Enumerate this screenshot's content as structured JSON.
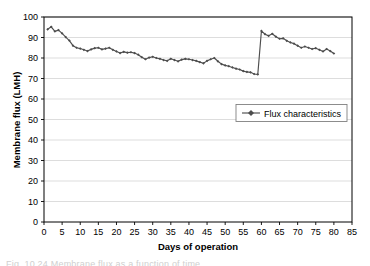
{
  "chart_data": {
    "type": "line",
    "title": "",
    "xlabel": "Days of operation",
    "ylabel": "Membrane flux (LMH)",
    "xlim": [
      0,
      85
    ],
    "ylim": [
      0,
      100
    ],
    "xticks": [
      0,
      5,
      10,
      15,
      20,
      25,
      30,
      35,
      40,
      45,
      50,
      55,
      60,
      65,
      70,
      75,
      80,
      85
    ],
    "yticks": [
      0,
      10,
      20,
      30,
      40,
      50,
      60,
      70,
      80,
      90,
      100
    ],
    "grid": "horizontal",
    "legend_position": "center-right",
    "series": [
      {
        "name": "Flux characteristics",
        "color": "#4d4d4d",
        "marker": "diamond",
        "x": [
          1,
          2,
          3,
          4,
          5,
          6,
          7,
          8,
          9,
          10,
          11,
          12,
          13,
          14,
          15,
          16,
          17,
          18,
          19,
          20,
          21,
          22,
          23,
          24,
          25,
          26,
          27,
          28,
          29,
          30,
          31,
          32,
          33,
          34,
          35,
          36,
          37,
          38,
          39,
          40,
          41,
          42,
          43,
          44,
          45,
          46,
          47,
          48,
          49,
          50,
          51,
          52,
          53,
          54,
          55,
          56,
          57,
          58,
          59,
          60,
          61,
          62,
          63,
          64,
          65,
          66,
          67,
          68,
          69,
          70,
          71,
          72,
          73,
          74,
          75,
          76,
          77,
          78,
          79,
          80
        ],
        "values": [
          94.0,
          95.2,
          93.0,
          93.6,
          92.0,
          90.2,
          88.5,
          86.0,
          85.0,
          84.6,
          84.0,
          83.4,
          84.2,
          84.8,
          85.0,
          84.2,
          84.6,
          85.0,
          84.0,
          83.2,
          82.4,
          83.0,
          82.6,
          82.8,
          82.4,
          81.6,
          80.4,
          79.4,
          80.2,
          80.6,
          80.0,
          79.6,
          79.0,
          78.6,
          79.6,
          79.0,
          78.4,
          79.2,
          79.6,
          79.4,
          79.0,
          78.6,
          78.0,
          77.4,
          78.6,
          79.4,
          80.0,
          78.4,
          77.0,
          76.4,
          76.0,
          75.4,
          74.8,
          74.4,
          73.6,
          73.2,
          73.0,
          72.2,
          72.0,
          93.2,
          91.6,
          90.8,
          91.8,
          90.4,
          89.4,
          89.6,
          88.4,
          87.6,
          87.0,
          86.0,
          85.0,
          85.6,
          85.0,
          84.4,
          84.8,
          84.0,
          83.2,
          84.4,
          83.4,
          82.2
        ]
      }
    ]
  },
  "legend": {
    "entries": [
      {
        "label": "Flux characteristics"
      }
    ]
  },
  "axes": {
    "y_title": "Membrane flux (LMH)",
    "x_title": "Days of operation",
    "x_tick_labels": [
      "0",
      "5",
      "10",
      "15",
      "20",
      "25",
      "30",
      "35",
      "40",
      "45",
      "50",
      "55",
      "60",
      "65",
      "70",
      "75",
      "80",
      "85"
    ],
    "y_tick_labels": [
      "0",
      "10",
      "20",
      "30",
      "40",
      "50",
      "60",
      "70",
      "80",
      "90",
      "100"
    ]
  },
  "caption": {
    "text": "Fig. 10.24  Membrane flux as a function of time"
  },
  "colors": {
    "series": "#4d4d4d",
    "grid": "#d9d9d9",
    "frame": "#000000",
    "background": "#ffffff"
  }
}
